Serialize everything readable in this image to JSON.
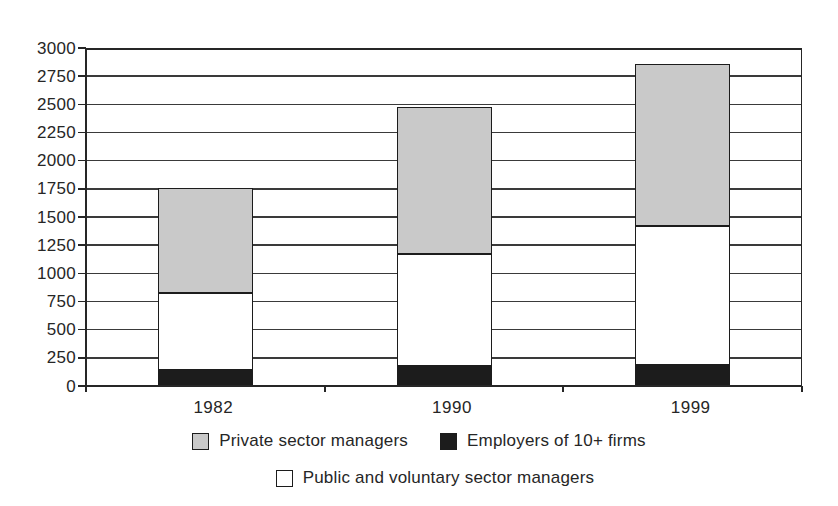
{
  "figure": {
    "background_color": "#ffffff",
    "line_color": "#262626",
    "gridline_color": "#3a3a3a"
  },
  "chart_data": {
    "type": "bar",
    "stacked": true,
    "title": "",
    "xlabel": "",
    "ylabel": "",
    "categories": [
      "1982",
      "1990",
      "1999"
    ],
    "series": [
      {
        "key": "employers",
        "name": "Employers of 10+ firms",
        "color": "#1c1c1c",
        "values": [
          140,
          180,
          185
        ]
      },
      {
        "key": "public",
        "name": "Public and voluntary sector managers",
        "color": "#ffffff",
        "values": [
          690,
          990,
          1235
        ]
      },
      {
        "key": "private",
        "name": "Private sector managers",
        "color": "#c9c9c9",
        "values": [
          930,
          1310,
          1440
        ]
      }
    ],
    "stack_totals": [
      1760,
      2480,
      2860
    ],
    "ylim": [
      0,
      3000
    ],
    "ytick_step": 250,
    "ytick_labels": [
      "0",
      "250",
      "500",
      "750",
      "1000",
      "1250",
      "1500",
      "1750",
      "2000",
      "2250",
      "2500",
      "2750",
      "3000"
    ],
    "grid": true,
    "legend_position": "bottom",
    "legend_rows": [
      [
        "private",
        "employers"
      ],
      [
        "public"
      ]
    ]
  }
}
